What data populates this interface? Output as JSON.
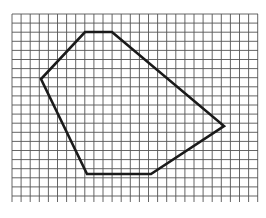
{
  "figure": {
    "type": "grid-polygon"
  },
  "grid": {
    "x_start": 12,
    "x_end": 258,
    "y_start": 14,
    "y_end": 202,
    "spacing": 9.1,
    "line_color": "#555555",
    "background": "#ffffff"
  },
  "polygon": {
    "stroke_color": "#1a1a1a",
    "stroke_width": 2.6,
    "vertices": [
      [
        85,
        32
      ],
      [
        112,
        32
      ],
      [
        224,
        126
      ],
      [
        151,
        174
      ],
      [
        87,
        174
      ],
      [
        41,
        79
      ]
    ]
  }
}
